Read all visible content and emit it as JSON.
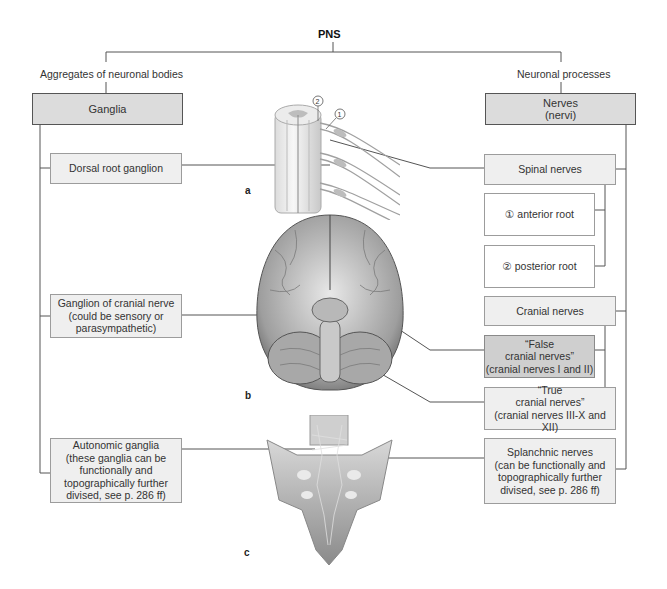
{
  "title": "PNS",
  "left": {
    "heading": "Aggregates of neuronal bodies",
    "header_box": "Ganglia",
    "items": [
      {
        "label": "Dorsal root ganglion"
      },
      {
        "label": "Ganglion of cranial nerve\n(could be sensory or\nparasympathetic)"
      },
      {
        "label": "Autonomic ganglia\n(these ganglia can be\nfunctionally and\ntopographically further\ndivised, see p. 286 ff)"
      }
    ]
  },
  "right": {
    "heading": "Neuronal processes",
    "header_box": "Nerves\n(nervi)",
    "items": [
      {
        "label": "Spinal nerves"
      },
      {
        "label": "① anterior root"
      },
      {
        "label": "② posterior root"
      },
      {
        "label": "Cranial nerves"
      },
      {
        "label": "“False\ncranial nerves”\n(cranial nerves I and II)"
      },
      {
        "label": "“True\ncranial nerves”\n(cranial nerves  III-X and XII)"
      },
      {
        "label": "Splanchnic nerves\n(can be functionally and\ntopographically further\ndivised, see p. 286 ff)"
      }
    ]
  },
  "figures": {
    "a": {
      "label": "a",
      "subject": "spinal-cord-segment",
      "callouts": [
        "①",
        "②"
      ]
    },
    "b": {
      "label": "b",
      "subject": "brain-inferior-view"
    },
    "c": {
      "label": "c",
      "subject": "sacrum-posterior-view"
    }
  },
  "colors": {
    "line": "#555555",
    "header_fill": "#dcdcdc",
    "box_fill": "#efefef",
    "dark_fill": "#cfcfcf"
  }
}
